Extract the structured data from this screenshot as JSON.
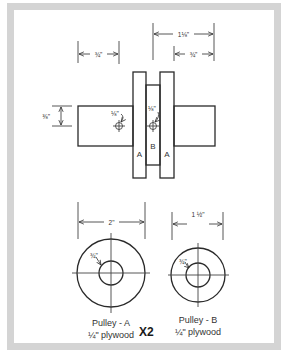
{
  "diagram": {
    "type": "technical-drawing",
    "frame_color": "#d4d4d4",
    "line_color": "#2a2a2a",
    "side_view": {
      "parts": [
        {
          "label": "A",
          "role": "outer pulley disc"
        },
        {
          "label": "B",
          "role": "center spacer disc"
        },
        {
          "label": "A",
          "role": "outer pulley disc"
        }
      ],
      "dimensions": {
        "left_shaft_length": "¾\"",
        "overall_right_width": "1⅛\"",
        "right_shaft_length": "¾\"",
        "shaft_height": "⅜\"",
        "pin_hole_left": "⅛\"",
        "pin_hole_center": "⅛\""
      }
    },
    "pulley_a": {
      "diameter": "2\"",
      "hole": "¾\"",
      "name": "Pulley - A",
      "material": "¼\" plywood",
      "quantity": "X2"
    },
    "pulley_b": {
      "diameter": "1 ½\"",
      "hole": "¾\"",
      "name": "Pulley - B",
      "material": "¼\" plywood"
    }
  }
}
